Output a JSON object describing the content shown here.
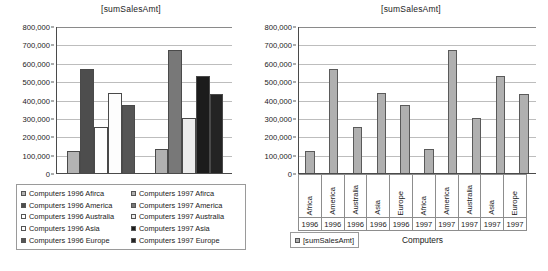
{
  "chart_data": [
    {
      "id": "left",
      "type": "bar",
      "title": "[sumSalesAmt]",
      "xlabel": "",
      "ylabel": "",
      "ylim": [
        0,
        800000
      ],
      "ytick_step": 100000,
      "ytick_labels": [
        "800,000",
        "700,000",
        "600,000",
        "500,000",
        "400,000",
        "300,000",
        "200,000",
        "100,000",
        "0"
      ],
      "grid": true,
      "legend_position": "bottom",
      "group_labels": [
        "1996",
        "1997"
      ],
      "series": [
        {
          "name": "Computers 1996 Afirca",
          "value": 125000,
          "color": "#b3b3b3",
          "group": "1996"
        },
        {
          "name": "Computers 1996 America",
          "value": 572000,
          "color": "#4d4d4d",
          "group": "1996"
        },
        {
          "name": "Computers 1996 Australia",
          "value": 258000,
          "color": "#ffffff",
          "group": "1996"
        },
        {
          "name": "Computers 1996 Asia",
          "value": 440000,
          "color": "#fdfdfd",
          "group": "1996"
        },
        {
          "name": "Computers 1996 Europe",
          "value": 376000,
          "color": "#555555",
          "group": "1996"
        },
        {
          "name": "Computers 1997 Afirca",
          "value": 135000,
          "color": "#b0b0b0",
          "group": "1997"
        },
        {
          "name": "Computers 1997 America",
          "value": 673000,
          "color": "#787878",
          "group": "1997"
        },
        {
          "name": "Computers 1997 Australia",
          "value": 303000,
          "color": "#ececec",
          "group": "1997"
        },
        {
          "name": "Computers 1997 Asia",
          "value": 534000,
          "color": "#1c1c1c",
          "group": "1997"
        },
        {
          "name": "Computers 1997 Europe",
          "value": 438000,
          "color": "#242424",
          "group": "1997"
        }
      ],
      "legend_items": [
        {
          "label": "Computers 1996 Afirca",
          "color": "#b3b3b3"
        },
        {
          "label": "Computers 1996 America",
          "color": "#4d4d4d"
        },
        {
          "label": "Computers 1996 Australia",
          "color": "#ffffff"
        },
        {
          "label": "Computers 1996 Asia",
          "color": "#fdfdfd"
        },
        {
          "label": "Computers 1996 Europe",
          "color": "#555555"
        },
        {
          "label": "Computers 1997 Afirca",
          "color": "#b0b0b0"
        },
        {
          "label": "Computers 1997 America",
          "color": "#787878"
        },
        {
          "label": "Computers 1997 Australia",
          "color": "#ececec"
        },
        {
          "label": "Computers 1997 Asia",
          "color": "#1c1c1c"
        },
        {
          "label": "Computers 1997 Europe",
          "color": "#242424"
        }
      ]
    },
    {
      "id": "right",
      "type": "bar",
      "title": "[sumSalesAmt]",
      "xlabel": "Computers",
      "ylabel": "",
      "ylim": [
        0,
        800000
      ],
      "ytick_step": 100000,
      "ytick_labels": [
        "800,000",
        "700,000",
        "600,000",
        "500,000",
        "400,000",
        "300,000",
        "200,000",
        "100,000",
        "0"
      ],
      "grid": true,
      "legend_position": "bottom-left",
      "legend_items": [
        {
          "label": "[sumSalesAmt]",
          "color": "#b0b0b0"
        }
      ],
      "bar_color": "#b0b0b0",
      "categories": [
        "Africa",
        "America",
        "Australia",
        "Asia",
        "Europe",
        "Africa",
        "America",
        "Australia",
        "Asia",
        "Europe"
      ],
      "years": [
        "1996",
        "1996",
        "1996",
        "1996",
        "1996",
        "1997",
        "1997",
        "1997",
        "1997",
        "1997"
      ],
      "values": [
        125000,
        572000,
        258000,
        440000,
        376000,
        135000,
        673000,
        303000,
        534000,
        438000
      ]
    }
  ]
}
